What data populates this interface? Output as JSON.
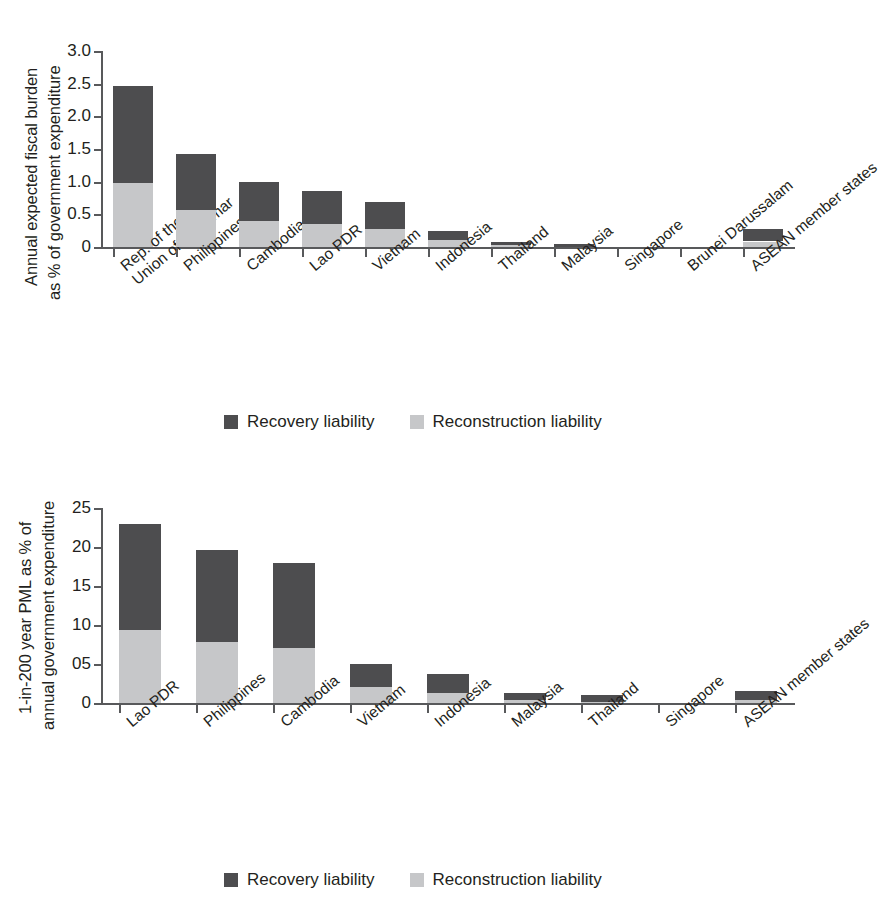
{
  "chart_data": [
    {
      "id": "top",
      "type": "bar",
      "stacked": true,
      "title": "",
      "ylabel": "Annual expected fiscal burden as % of government expenditure",
      "ylabel_lines": [
        "Annual expected fiscal burden",
        "as % of government expenditure"
      ],
      "xlabel": "",
      "ylim": [
        0,
        3.0
      ],
      "yticks": [
        0,
        0.5,
        1.0,
        1.5,
        2.0,
        2.5,
        3.0
      ],
      "ytick_labels": [
        "0",
        "0.5",
        "1.0",
        "1.5",
        "2.0",
        "2.5",
        "3.0"
      ],
      "grid": false,
      "legend_position": "bottom",
      "categories": [
        "Rep. of the Union of Myanmar",
        "Philippines",
        "Cambodia",
        "Lao PDR",
        "Vietnam",
        "Indonesia",
        "Thailand",
        "Malaysia",
        "Singapore",
        "Brunei Darussalam",
        "ASEAN member states"
      ],
      "category_lines": [
        [
          "Rep. of the",
          "Union of Myanmar"
        ],
        [
          "Philippines"
        ],
        [
          "Cambodia"
        ],
        [
          "Lao PDR"
        ],
        [
          "Vietnam"
        ],
        [
          "Indonesia"
        ],
        [
          "Thailand"
        ],
        [
          "Malaysia"
        ],
        [
          "Singapore"
        ],
        [
          "Brunei Darussalam"
        ],
        [
          "ASEAN member states"
        ]
      ],
      "series": [
        {
          "name": "Reconstruction liability",
          "color": "#c6c7c9",
          "values": [
            0.98,
            0.56,
            0.4,
            0.35,
            0.27,
            0.11,
            0.03,
            0.0,
            0.0,
            0.0,
            0.08
          ]
        },
        {
          "name": "Recovery liability",
          "color": "#4d4d4f",
          "values": [
            1.49,
            0.86,
            0.59,
            0.51,
            0.42,
            0.14,
            0.04,
            0.05,
            0.0,
            0.0,
            0.19
          ]
        }
      ],
      "totals": [
        2.47,
        1.42,
        0.99,
        0.86,
        0.69,
        0.25,
        0.07,
        0.05,
        0.0,
        0.0,
        0.27
      ]
    },
    {
      "id": "bottom",
      "type": "bar",
      "stacked": true,
      "title": "",
      "ylabel": "1-in-200 year PML as % of annual government expenditure",
      "ylabel_lines": [
        "1-in-200 year PML as % of",
        "annual government expenditure"
      ],
      "xlabel": "",
      "ylim": [
        0,
        25
      ],
      "yticks": [
        0,
        5,
        10,
        15,
        20,
        25
      ],
      "ytick_labels": [
        "0",
        "05",
        "10",
        "15",
        "20",
        "25"
      ],
      "grid": false,
      "legend_position": "bottom",
      "categories": [
        "Lao PDR",
        "Philippines",
        "Cambodia",
        "Vietnam",
        "Indonesia",
        "Malaysia",
        "Thailand",
        "Singapore",
        "ASEAN member states"
      ],
      "category_lines": [
        [
          "Lao PDR"
        ],
        [
          "Philippines"
        ],
        [
          "Cambodia"
        ],
        [
          "Vietnam"
        ],
        [
          "Indonesia"
        ],
        [
          "Malaysia"
        ],
        [
          "Thailand"
        ],
        [
          "Singapore"
        ],
        [
          "ASEAN member states"
        ]
      ],
      "series": [
        {
          "name": "Reconstruction liability",
          "color": "#c6c7c9",
          "values": [
            9.3,
            7.8,
            7.1,
            2.0,
            1.3,
            0.35,
            0.1,
            0.0,
            0.35
          ]
        },
        {
          "name": "Recovery liability",
          "color": "#4d4d4f",
          "values": [
            13.7,
            11.8,
            10.9,
            3.0,
            2.4,
            0.95,
            0.9,
            0.0,
            1.25
          ]
        }
      ],
      "totals": [
        23.0,
        19.6,
        18.0,
        5.0,
        3.7,
        1.3,
        1.0,
        0.0,
        1.6
      ]
    }
  ],
  "legend": {
    "items": [
      {
        "label": "Recovery liability",
        "color": "#4d4d4f"
      },
      {
        "label": "Reconstruction liability",
        "color": "#c6c7c9"
      }
    ]
  },
  "colors": {
    "recovery": "#4d4d4f",
    "reconstruction": "#c6c7c9",
    "axis": "#58595b",
    "text": "#231f20",
    "background": "#ffffff"
  }
}
